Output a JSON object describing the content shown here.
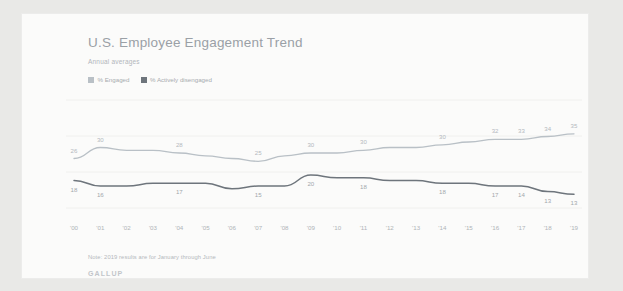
{
  "card": {
    "title": "U.S. Employee Engagement Trend",
    "subtitle": "Annual averages",
    "note": "Note: 2019 results are for January through June",
    "brand": "GALLUP"
  },
  "legend": {
    "items": [
      {
        "label": "% Engaged",
        "color": "#b9c0c6"
      },
      {
        "label": "% Actively disengaged",
        "color": "#6e757c"
      }
    ]
  },
  "chart_data": {
    "type": "line",
    "title": "U.S. Employee Engagement Trend",
    "subtitle": "Annual averages",
    "xlabel": "",
    "ylabel": "",
    "ylim": [
      8,
      40
    ],
    "grid": true,
    "legend_position": "top-left",
    "categories": [
      "'00",
      "'01",
      "'02",
      "'03",
      "'04",
      "'05",
      "'06",
      "'07",
      "'08",
      "'09",
      "'10",
      "'11",
      "'12",
      "'13",
      "'14",
      "'15",
      "'16",
      "'17",
      "'18",
      "'19"
    ],
    "series": [
      {
        "name": "% Engaged",
        "color": "#b9c0c6",
        "values": [
          26,
          30,
          29,
          29,
          28,
          27,
          26,
          25,
          27,
          28,
          28,
          29,
          30,
          30,
          31,
          32,
          33,
          33,
          34,
          35
        ],
        "labels": [
          {
            "index": 0,
            "text": "26"
          },
          {
            "index": 1,
            "text": "30"
          },
          {
            "index": 4,
            "text": "28"
          },
          {
            "index": 7,
            "text": "25"
          },
          {
            "index": 9,
            "text": "30"
          },
          {
            "index": 11,
            "text": "30"
          },
          {
            "index": 14,
            "text": "30"
          },
          {
            "index": 16,
            "text": "32"
          },
          {
            "index": 17,
            "text": "33"
          },
          {
            "index": 18,
            "text": "34"
          },
          {
            "index": 19,
            "text": "35"
          }
        ]
      },
      {
        "name": "% Actively disengaged",
        "color": "#6e757c",
        "values": [
          18,
          16,
          16,
          17,
          17,
          17,
          15,
          16,
          16,
          20,
          19,
          19,
          18,
          18,
          17,
          17,
          16,
          16,
          14,
          13
        ],
        "labels": [
          {
            "index": 0,
            "text": "18"
          },
          {
            "index": 1,
            "text": "16"
          },
          {
            "index": 4,
            "text": "17"
          },
          {
            "index": 7,
            "text": "15"
          },
          {
            "index": 9,
            "text": "20"
          },
          {
            "index": 11,
            "text": "18"
          },
          {
            "index": 14,
            "text": "18"
          },
          {
            "index": 16,
            "text": "17"
          },
          {
            "index": 17,
            "text": "14"
          },
          {
            "index": 18,
            "text": "13"
          },
          {
            "index": 19,
            "text": "13"
          }
        ]
      }
    ]
  }
}
